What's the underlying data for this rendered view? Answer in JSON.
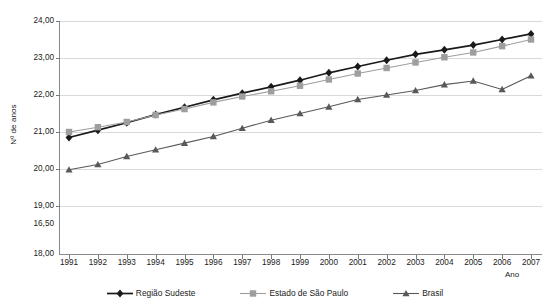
{
  "chart_data": {
    "type": "line",
    "title": "",
    "xlabel": "Ano",
    "ylabel": "Nº de anos",
    "categories": [
      "1991",
      "1992",
      "1993",
      "1994",
      "1995",
      "1996",
      "1997",
      "1998",
      "1999",
      "2000",
      "2001",
      "2002",
      "2003",
      "2004",
      "2005",
      "2006",
      "2007"
    ],
    "ytick_labels": [
      "24,00",
      "23,00",
      "22,00",
      "21,00",
      "20,00",
      "19,00",
      "16,50",
      "18,00"
    ],
    "ylim": [
      18.0,
      24.0
    ],
    "grid": true,
    "legend_position": "bottom",
    "series": [
      {
        "name": "Região Sudeste",
        "color": "#1a1a1a",
        "marker": "diamond",
        "values": [
          20.85,
          21.05,
          21.25,
          21.47,
          21.67,
          21.87,
          22.05,
          22.22,
          22.4,
          22.6,
          22.77,
          22.94,
          23.1,
          23.22,
          23.35,
          23.5,
          23.65
        ]
      },
      {
        "name": "Estado de São Paulo",
        "color": "#9e9e9e",
        "marker": "square",
        "values": [
          21.0,
          21.13,
          21.27,
          21.46,
          21.62,
          21.8,
          21.96,
          22.1,
          22.25,
          22.42,
          22.58,
          22.73,
          22.88,
          23.02,
          23.15,
          23.32,
          23.5
        ]
      },
      {
        "name": "Brasil",
        "color": "#595959",
        "marker": "triangle",
        "values": [
          19.98,
          20.12,
          20.34,
          20.52,
          20.7,
          20.88,
          21.1,
          21.32,
          21.5,
          21.68,
          21.88,
          22.0,
          22.12,
          22.28,
          22.38,
          22.15,
          22.52
        ]
      }
    ]
  }
}
